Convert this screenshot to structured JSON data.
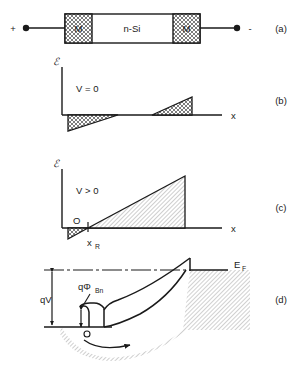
{
  "figure": {
    "panels": [
      {
        "id": "a",
        "label": "(a)",
        "caption": "device cross-section"
      },
      {
        "id": "b",
        "label": "(b)",
        "caption": "electric field at zero bias"
      },
      {
        "id": "c",
        "label": "(c)",
        "caption": "electric field at forward bias"
      },
      {
        "id": "d",
        "label": "(d)",
        "caption": "energy band diagram"
      }
    ]
  },
  "panel_a": {
    "terminal_plus": "+",
    "terminal_minus": "-",
    "metal_left": "M",
    "metal_right": "M",
    "semiconductor": "n-Si",
    "panel_label": "(a)"
  },
  "panel_b": {
    "y_axis_symbol": "ℰ",
    "x_axis_label": "x",
    "bias_label": "V = 0",
    "panel_label": "(b)"
  },
  "panel_c": {
    "y_axis_symbol": "ℰ",
    "x_axis_label": "x",
    "bias_label": "V > 0",
    "origin_label": "O",
    "depletion_edge_label": "x",
    "depletion_edge_sub": "R",
    "panel_label": "(c)"
  },
  "panel_d": {
    "fermi_label": "E",
    "fermi_sub": "F",
    "applied_bias_label": "qV",
    "barrier_label": "qΦ",
    "barrier_sub": "Bn",
    "carrier_symbol": "o",
    "panel_label": "(d)"
  },
  "colors": {
    "ink": "#1a1a1a",
    "hatch": "#808080",
    "metal_fill": "#d8d8d8",
    "paper": "#ffffff"
  }
}
